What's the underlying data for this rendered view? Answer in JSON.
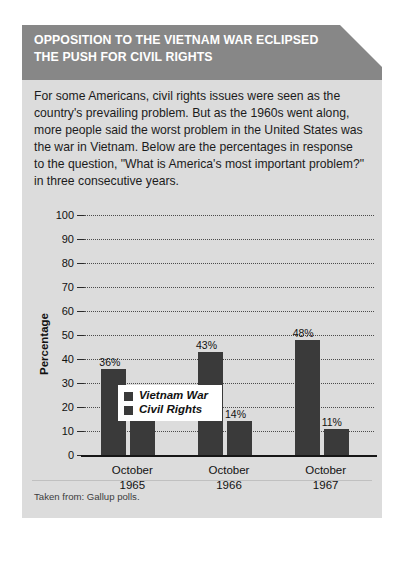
{
  "header": {
    "title_line1": "OPPOSITION TO THE VIETNAM WAR ECLIPSED",
    "title_line2": "THE PUSH FOR CIVIL RIGHTS",
    "background_color": "#878787",
    "text_color": "#ffffff"
  },
  "body": {
    "paragraph": "For some Americans, civil rights issues were seen as the country's prevailing problem. But as the 1960s went along, more people said the worst problem in the United States was the war in Vietnam. Below are the percentages in response to the question, \"What is America's most important problem?\" in three consecutive years."
  },
  "footer": {
    "source": "Taken from: Gallup polls."
  },
  "card": {
    "background_color": "#dcdcdc"
  },
  "chart_data": {
    "type": "bar",
    "title": "",
    "xlabel": "",
    "ylabel": "Percentage",
    "ylim": [
      0,
      100
    ],
    "ytick_labels": [
      "0",
      "10",
      "20",
      "30",
      "40",
      "50",
      "60",
      "70",
      "80",
      "90",
      "100"
    ],
    "yticks": [
      0,
      10,
      20,
      30,
      40,
      50,
      60,
      70,
      80,
      90,
      100
    ],
    "grid": true,
    "grid_axis": "y",
    "legend_position": "upper-left-inside",
    "categories": [
      "October 1965",
      "October 1966",
      "October 1967"
    ],
    "category_lines": [
      [
        "October",
        "1965"
      ],
      [
        "October",
        "1966"
      ],
      [
        "October",
        "1967"
      ]
    ],
    "series": [
      {
        "name": "Vietnam War",
        "color": "#3a3a3a",
        "values": [
          36,
          43,
          48
        ],
        "data_labels": [
          "36%",
          "43%",
          "48%"
        ]
      },
      {
        "name": "Civil Rights",
        "color": "#3a3a3a",
        "values": [
          16,
          14,
          11
        ],
        "data_labels": [
          "16%",
          "14%",
          "11%"
        ]
      }
    ]
  }
}
